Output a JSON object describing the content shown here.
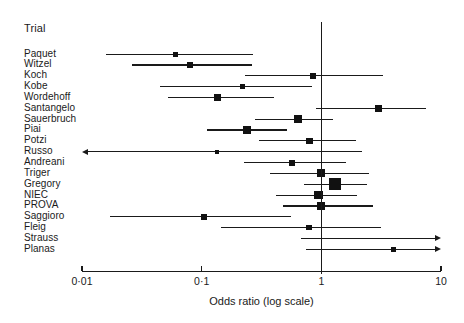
{
  "header": {
    "column_title": "Trial"
  },
  "axis": {
    "title": "Odds ratio (log scale)",
    "tick_labels": [
      "0·01",
      "0·1",
      "1",
      "10"
    ],
    "tick_values": [
      0.01,
      0.1,
      1,
      10
    ],
    "null_value": 1
  },
  "chart_data": {
    "type": "scatter",
    "title": "",
    "subtitle": "",
    "xlabel": "Odds ratio (log scale)",
    "ylabel": "Trial",
    "xscale": "log",
    "xlim": [
      0.01,
      10
    ],
    "xticks": [
      0.01,
      0.1,
      1,
      10
    ],
    "xticklabels": [
      "0·01",
      "0·1",
      "1",
      "10"
    ],
    "grid": false,
    "legend": "none",
    "reference_line": 1,
    "categories": [
      "Paquet",
      "Witzel",
      "Koch",
      "Kobe",
      "Wordehoff",
      "Santangelo",
      "Sauerbruch",
      "Piai",
      "Potzi",
      "Russo",
      "Andreani",
      "Triger",
      "Gregory",
      "NIEC",
      "PROVA",
      "Saggioro",
      "Fleig",
      "Strauss",
      "Planas"
    ],
    "series": [
      {
        "name": "Odds ratio with 95% CI",
        "points": [
          {
            "trial": "Paquet",
            "or": 0.06,
            "ci_low": 0.016,
            "ci_high": 0.27,
            "weight": 2.0,
            "arrow_left": false,
            "arrow_right": false
          },
          {
            "trial": "Witzel",
            "or": 0.08,
            "ci_low": 0.026,
            "ci_high": 0.265,
            "weight": 3.5,
            "arrow_left": false,
            "arrow_right": false
          },
          {
            "trial": "Koch",
            "or": 0.85,
            "ci_low": 0.23,
            "ci_high": 3.3,
            "weight": 2.5,
            "arrow_left": false,
            "arrow_right": false
          },
          {
            "trial": "Kobe",
            "or": 0.22,
            "ci_low": 0.045,
            "ci_high": 0.84,
            "weight": 2.0,
            "arrow_left": false,
            "arrow_right": false
          },
          {
            "trial": "Wordehoff",
            "or": 0.135,
            "ci_low": 0.052,
            "ci_high": 0.4,
            "weight": 4.5,
            "arrow_left": false,
            "arrow_right": false
          },
          {
            "trial": "Santangelo",
            "or": 3.0,
            "ci_low": 0.9,
            "ci_high": 7.5,
            "weight": 4.5,
            "arrow_left": false,
            "arrow_right": false
          },
          {
            "trial": "Sauerbruch",
            "or": 0.64,
            "ci_low": 0.28,
            "ci_high": 1.24,
            "weight": 5.5,
            "arrow_left": false,
            "arrow_right": false
          },
          {
            "trial": "Piai",
            "or": 0.24,
            "ci_low": 0.11,
            "ci_high": 0.52,
            "weight": 5.5,
            "arrow_left": false,
            "arrow_right": false
          },
          {
            "trial": "Potzi",
            "or": 0.8,
            "ci_low": 0.3,
            "ci_high": 1.95,
            "weight": 3.5,
            "arrow_left": false,
            "arrow_right": false
          },
          {
            "trial": "Russo",
            "or": 0.135,
            "ci_low": 0.01,
            "ci_high": 2.2,
            "weight": 1.0,
            "arrow_left": true,
            "arrow_right": false
          },
          {
            "trial": "Andreani",
            "or": 0.57,
            "ci_low": 0.225,
            "ci_high": 1.6,
            "weight": 3.0,
            "arrow_left": false,
            "arrow_right": false
          },
          {
            "trial": "Triger",
            "or": 0.99,
            "ci_low": 0.37,
            "ci_high": 2.5,
            "weight": 5.0,
            "arrow_left": false,
            "arrow_right": false
          },
          {
            "trial": "Gregory",
            "or": 1.3,
            "ci_low": 0.72,
            "ci_high": 2.4,
            "weight": 9.0,
            "arrow_left": false,
            "arrow_right": false
          },
          {
            "trial": "NIEC",
            "or": 0.95,
            "ci_low": 0.42,
            "ci_high": 2.0,
            "weight": 5.5,
            "arrow_left": false,
            "arrow_right": false
          },
          {
            "trial": "PROVA",
            "or": 0.99,
            "ci_low": 0.48,
            "ci_high": 2.7,
            "weight": 5.5,
            "arrow_left": false,
            "arrow_right": false
          },
          {
            "trial": "Saggioro",
            "or": 0.105,
            "ci_low": 0.017,
            "ci_high": 0.56,
            "weight": 2.5,
            "arrow_left": false,
            "arrow_right": false
          },
          {
            "trial": "Fleig",
            "or": 0.79,
            "ci_low": 0.145,
            "ci_high": 3.15,
            "weight": 2.5,
            "arrow_left": false,
            "arrow_right": false
          },
          {
            "trial": "Strauss",
            "or": null,
            "ci_low": 0.68,
            "ci_high": 10.0,
            "weight": 0.0,
            "arrow_left": false,
            "arrow_right": true
          },
          {
            "trial": "Planas",
            "or": 4.0,
            "ci_low": 0.75,
            "ci_high": 10.0,
            "weight": 2.0,
            "arrow_left": false,
            "arrow_right": true
          }
        ]
      }
    ]
  },
  "layout": {
    "axis_y": 271,
    "axis_x_left": 82,
    "axis_x_right": 441,
    "row_start_y": 53.5,
    "row_step": 10.85,
    "null_line_top": 22,
    "tick_label_y": 275,
    "axis_title_y": 295
  },
  "colors": {
    "ink": "#1a1a1a",
    "marker": "#111111",
    "background": "#ffffff"
  }
}
